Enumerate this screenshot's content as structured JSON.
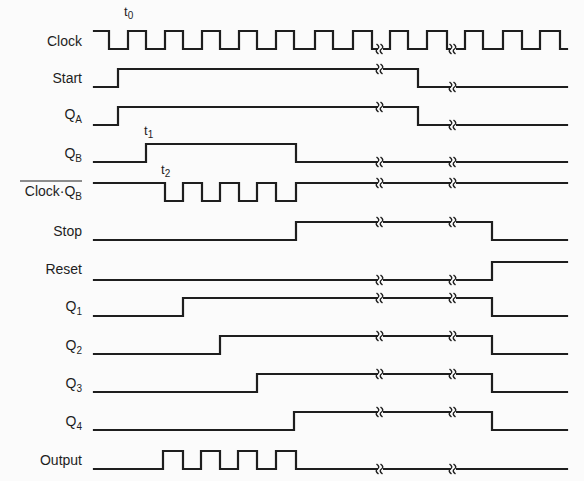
{
  "diagram": {
    "type": "timing-diagram",
    "x_start": 94,
    "x_end": 567,
    "break_x": [
      380,
      453
    ],
    "time_markers": [
      {
        "label": "t",
        "sub": "0",
        "x": 124,
        "y": 16
      },
      {
        "label": "t",
        "sub": "1",
        "x": 144,
        "y": 135
      },
      {
        "label": "t",
        "sub": "2",
        "x": 161,
        "y": 174
      }
    ],
    "signals": [
      {
        "name": "Clock",
        "sub": "",
        "overline": false,
        "high_y": 31,
        "low_y": 49,
        "label_y": 46,
        "initial": 1,
        "edges": [
          109,
          128,
          146,
          165,
          183,
          202,
          220,
          239,
          257,
          276,
          294,
          315,
          333,
          353,
          372,
          390,
          408,
          427,
          447,
          465,
          483,
          503,
          522,
          540,
          560
        ]
      },
      {
        "name": "Start",
        "sub": "",
        "overline": false,
        "high_y": 69,
        "low_y": 87,
        "label_y": 83,
        "initial": 0,
        "edges": [
          118,
          418
        ]
      },
      {
        "name": "Q",
        "sub": "A",
        "overline": false,
        "high_y": 107,
        "low_y": 125,
        "label_y": 119,
        "initial": 0,
        "edges": [
          118,
          418
        ]
      },
      {
        "name": "Q",
        "sub": "B",
        "overline": false,
        "high_y": 144,
        "low_y": 162,
        "label_y": 158,
        "initial": 0,
        "edges": [
          146,
          296
        ]
      },
      {
        "name": "Clock·Q",
        "sub": "B",
        "overline": true,
        "high_y": 183,
        "low_y": 201,
        "label_y": 196,
        "initial": 1,
        "edges": [
          165,
          183,
          202,
          220,
          239,
          257,
          276,
          296
        ]
      },
      {
        "name": "Stop",
        "sub": "",
        "overline": false,
        "high_y": 222,
        "low_y": 240,
        "label_y": 236,
        "initial": 0,
        "edges": [
          296,
          492
        ]
      },
      {
        "name": "Reset",
        "sub": "",
        "overline": false,
        "high_y": 262,
        "low_y": 280,
        "label_y": 274,
        "initial": 0,
        "edges": [
          492
        ]
      },
      {
        "name": "Q",
        "sub": "1",
        "overline": false,
        "high_y": 298,
        "low_y": 316,
        "label_y": 311,
        "initial": 0,
        "edges": [
          183,
          492
        ]
      },
      {
        "name": "Q",
        "sub": "2",
        "overline": false,
        "high_y": 336,
        "low_y": 354,
        "label_y": 350,
        "initial": 0,
        "edges": [
          220,
          492
        ]
      },
      {
        "name": "Q",
        "sub": "3",
        "overline": false,
        "high_y": 374,
        "low_y": 392,
        "label_y": 388,
        "initial": 0,
        "edges": [
          257,
          492
        ]
      },
      {
        "name": "Q",
        "sub": "4",
        "overline": false,
        "high_y": 412,
        "low_y": 430,
        "label_y": 426,
        "initial": 0,
        "edges": [
          294,
          492
        ]
      },
      {
        "name": "Output",
        "sub": "",
        "overline": false,
        "high_y": 451,
        "low_y": 469,
        "label_y": 465,
        "initial": 0,
        "edges": [
          163,
          183,
          201,
          220,
          238,
          257,
          276,
          296
        ]
      }
    ]
  }
}
